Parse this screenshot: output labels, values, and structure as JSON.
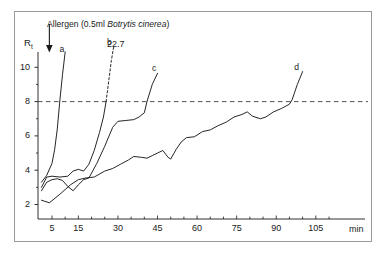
{
  "figure": {
    "annotation": {
      "prefix": "Allergen (0.5ml ",
      "italic": "Botrytis cinerea",
      "suffix": ")",
      "full_text": "Allergen (0.5ml Botrytis cinerea)",
      "arrow_icon": "down-arrow-icon",
      "arrow_time_min": 4
    },
    "threshold": {
      "value": 8,
      "style": "dashed",
      "color": "#555555"
    },
    "frame_color": "#9a9a9a",
    "line_color": "#1a1a1a"
  },
  "chart_data": {
    "type": "line",
    "xlabel": "min",
    "ylabel": "R",
    "ylabel_sub": "t",
    "ylim": [
      0,
      11.6
    ],
    "xlim": [
      0,
      112
    ],
    "grid": false,
    "legend": "inline-end-labels",
    "yticks": [
      2,
      4,
      6,
      8,
      10
    ],
    "ytick_labels": [
      "2",
      "4",
      "6",
      "8",
      "10"
    ],
    "xticks": [
      5,
      10,
      15,
      20,
      25,
      30,
      35,
      40,
      45,
      50,
      55,
      60,
      65,
      70,
      75,
      80,
      85,
      90,
      95,
      100,
      105,
      110
    ],
    "xtick_labels_shown": [
      "5",
      "15",
      "30",
      "45",
      "60",
      "75",
      "90",
      "105"
    ],
    "xtick_label_values": [
      5,
      15,
      30,
      45,
      60,
      75,
      90,
      105
    ],
    "threshold_line": {
      "y": 8,
      "label": "",
      "style": "dashed"
    },
    "annotations": [
      {
        "name": "b-extrapolated-value",
        "text": "22.7",
        "x": 30,
        "y": 11.3
      }
    ],
    "series": [
      {
        "name": "a",
        "label": "a",
        "label_x": 9,
        "label_y": 11.0,
        "style": "solid",
        "points": [
          [
            1,
            3.3
          ],
          [
            3,
            3.7
          ],
          [
            5,
            4.4
          ],
          [
            6,
            5.2
          ],
          [
            7,
            6.4
          ],
          [
            8,
            8.1
          ],
          [
            9,
            9.6
          ],
          [
            10,
            10.9
          ]
        ]
      },
      {
        "name": "b",
        "label": "b",
        "label_x": 27,
        "label_y": 11.4,
        "style": "solid-then-dashed",
        "points": [
          [
            1,
            3.0
          ],
          [
            3,
            3.6
          ],
          [
            5,
            3.65
          ],
          [
            8,
            3.6
          ],
          [
            11,
            3.65
          ],
          [
            13,
            3.95
          ],
          [
            15,
            4.05
          ],
          [
            17,
            3.95
          ],
          [
            19,
            4.35
          ],
          [
            21,
            5.15
          ],
          [
            23,
            6.2
          ],
          [
            24.5,
            7.1
          ],
          [
            25.5,
            8.0
          ]
        ],
        "dashed_points": [
          [
            25.5,
            8.0
          ],
          [
            26.5,
            9.2
          ],
          [
            27.5,
            10.4
          ],
          [
            28.5,
            11.3
          ]
        ],
        "extrapolated_value": 22.7
      },
      {
        "name": "c",
        "label": "c",
        "label_x": 44,
        "label_y": 9.9,
        "style": "solid",
        "points": [
          [
            1,
            2.8
          ],
          [
            3,
            3.3
          ],
          [
            5,
            3.45
          ],
          [
            7,
            3.5
          ],
          [
            9,
            3.4
          ],
          [
            11,
            3.05
          ],
          [
            13,
            2.8
          ],
          [
            15,
            3.15
          ],
          [
            17,
            3.45
          ],
          [
            19,
            3.55
          ],
          [
            22,
            4.4
          ],
          [
            25,
            5.4
          ],
          [
            28,
            6.5
          ],
          [
            30,
            6.85
          ],
          [
            33,
            6.9
          ],
          [
            36,
            6.95
          ],
          [
            38,
            7.1
          ],
          [
            40,
            7.35
          ],
          [
            41,
            8.0
          ],
          [
            43,
            9.0
          ],
          [
            45,
            9.65
          ]
        ]
      },
      {
        "name": "d",
        "label": "d",
        "label_x": 98,
        "label_y": 9.95,
        "style": "solid",
        "points": [
          [
            1,
            2.25
          ],
          [
            4,
            2.1
          ],
          [
            8,
            2.6
          ],
          [
            12,
            3.15
          ],
          [
            15,
            3.45
          ],
          [
            18,
            3.55
          ],
          [
            21,
            3.6
          ],
          [
            25,
            3.95
          ],
          [
            28,
            4.1
          ],
          [
            31,
            4.35
          ],
          [
            34,
            4.6
          ],
          [
            36,
            4.8
          ],
          [
            39,
            4.75
          ],
          [
            41,
            4.7
          ],
          [
            43,
            4.85
          ],
          [
            45,
            5.0
          ],
          [
            47,
            5.15
          ],
          [
            49,
            4.75
          ],
          [
            50,
            4.65
          ],
          [
            52,
            5.2
          ],
          [
            54,
            5.65
          ],
          [
            56,
            5.9
          ],
          [
            59,
            5.95
          ],
          [
            62,
            6.25
          ],
          [
            65,
            6.35
          ],
          [
            68,
            6.6
          ],
          [
            71,
            6.8
          ],
          [
            74,
            7.1
          ],
          [
            77,
            7.25
          ],
          [
            79,
            7.4
          ],
          [
            81,
            7.15
          ],
          [
            84,
            7.0
          ],
          [
            86,
            7.1
          ],
          [
            89,
            7.4
          ],
          [
            92,
            7.6
          ],
          [
            95,
            7.85
          ],
          [
            96,
            8.1
          ],
          [
            98,
            9.0
          ],
          [
            100,
            9.75
          ]
        ]
      }
    ]
  }
}
